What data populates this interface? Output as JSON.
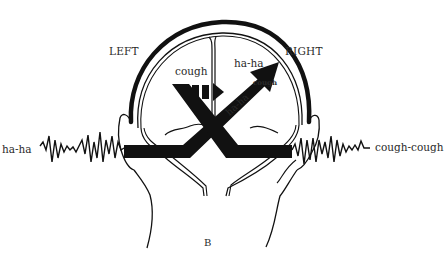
{
  "diagram": {
    "panel_label": "B",
    "hemispheres": {
      "left_label": "LEFT",
      "right_label": "RIGHT"
    },
    "inputs": {
      "left_ear": "ha-ha",
      "right_ear": "cough-cough"
    },
    "brain_labels": {
      "left_hemisphere_word": "cough",
      "right_hemisphere_word": "ha-ha",
      "right_arrow_tip_word": "cough",
      "crossing_path_word": "ha-ha"
    },
    "colors": {
      "ink": "#111111",
      "text": "#2a2a2a",
      "background": "#ffffff"
    },
    "icons": {
      "solid_arrow": "arrow-up-right-icon",
      "dashed_arrow": "arrow-right-dashed-icon",
      "sound_wave": "sound-wave-icon"
    }
  }
}
